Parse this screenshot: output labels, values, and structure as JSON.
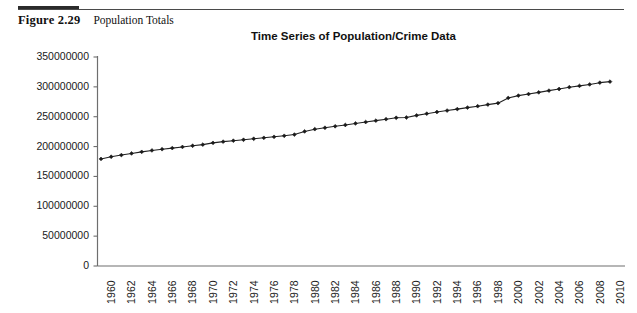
{
  "figure": {
    "number": "Figure 2.29",
    "title": "Population Totals"
  },
  "chart_data": {
    "type": "line",
    "title": "Time Series of Population/Crime Data",
    "xlabel": "",
    "ylabel": "",
    "ylim": [
      0,
      350000000
    ],
    "xlim": [
      1960,
      2010
    ],
    "grid": false,
    "legend": false,
    "marker": "diamond",
    "line_color": "#222222",
    "ytick_labels": [
      "350000000",
      "300000000",
      "250000000",
      "200000000",
      "150000000",
      "100000000",
      "50000000",
      "0"
    ],
    "ytick_values": [
      350000000,
      300000000,
      250000000,
      200000000,
      150000000,
      100000000,
      50000000,
      0
    ],
    "xtick_labels": [
      "1960",
      "1962",
      "1964",
      "1966",
      "1968",
      "1970",
      "1972",
      "1974",
      "1976",
      "1978",
      "1980",
      "1982",
      "1984",
      "1986",
      "1988",
      "1990",
      "1992",
      "1994",
      "1996",
      "1998",
      "2000",
      "2002",
      "2004",
      "2006",
      "2008",
      "2010"
    ],
    "x": [
      1960,
      1961,
      1962,
      1963,
      1964,
      1965,
      1966,
      1967,
      1968,
      1969,
      1970,
      1971,
      1972,
      1973,
      1974,
      1975,
      1976,
      1977,
      1978,
      1979,
      1980,
      1981,
      1982,
      1983,
      1984,
      1985,
      1986,
      1987,
      1988,
      1989,
      1990,
      1991,
      1992,
      1993,
      1994,
      1995,
      1996,
      1997,
      1998,
      1999,
      2000,
      2001,
      2002,
      2003,
      2004,
      2005,
      2006,
      2007,
      2008,
      2009,
      2010
    ],
    "values": [
      179323000,
      182992000,
      185771000,
      188483000,
      191141000,
      193526000,
      195576000,
      197457000,
      199399000,
      201385000,
      203235000,
      206212000,
      208230000,
      209851000,
      211392000,
      213124000,
      214659000,
      216332000,
      218059000,
      220099000,
      225349000,
      229146000,
      231534000,
      233981000,
      236158000,
      238740000,
      241077000,
      243400000,
      245807000,
      248239000,
      248709000,
      252177000,
      255082000,
      257908000,
      260341000,
      262755000,
      265284000,
      267637000,
      270296000,
      272691000,
      281422000,
      285318000,
      287973000,
      290788000,
      293657000,
      296410000,
      299398000,
      301621000,
      304060000,
      307007000,
      308746000
    ]
  }
}
